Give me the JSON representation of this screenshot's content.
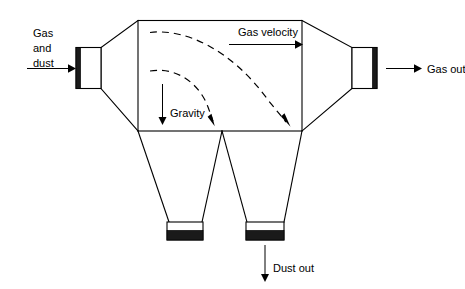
{
  "diagram": {
    "type": "process-equipment-schematic",
    "colors": {
      "line": "#000000",
      "flange_band": "#1a1a1a",
      "background": "#ffffff"
    },
    "labels": {
      "inlet_line1": "Gas",
      "inlet_line2": "and",
      "inlet_line3": "dust",
      "gas_velocity": "Gas velocity",
      "gravity": "Gravity",
      "gas_out": "Gas out",
      "dust_out": "Dust out"
    },
    "flow_arrows": [
      {
        "name": "inlet-arrow",
        "label": "Gas and dust",
        "direction": "right"
      },
      {
        "name": "gas-velocity-arrow",
        "label": "Gas velocity",
        "direction": "right"
      },
      {
        "name": "gravity-arrow",
        "label": "Gravity",
        "direction": "down"
      },
      {
        "name": "gas-out-arrow",
        "label": "Gas out",
        "direction": "right"
      },
      {
        "name": "dust-out-arrow",
        "label": "Dust out",
        "direction": "down"
      }
    ],
    "particle_trajectories": [
      {
        "name": "upper-trajectory",
        "style": "dashed",
        "shape": "parabolic-arc",
        "ends_with": "arrowhead"
      },
      {
        "name": "lower-trajectory",
        "style": "dashed",
        "shape": "parabolic-arc",
        "ends_with": "arrowhead"
      }
    ],
    "components": [
      {
        "name": "inlet-flange",
        "kind": "flange"
      },
      {
        "name": "inlet-expansion-cone",
        "kind": "transition"
      },
      {
        "name": "settling-chamber-body",
        "kind": "chamber"
      },
      {
        "name": "outlet-contraction-cone",
        "kind": "transition"
      },
      {
        "name": "outlet-flange",
        "kind": "flange"
      },
      {
        "name": "left-hopper",
        "kind": "hopper"
      },
      {
        "name": "right-hopper",
        "kind": "hopper"
      },
      {
        "name": "left-hopper-flange",
        "kind": "flange"
      },
      {
        "name": "right-hopper-flange",
        "kind": "flange"
      }
    ]
  }
}
